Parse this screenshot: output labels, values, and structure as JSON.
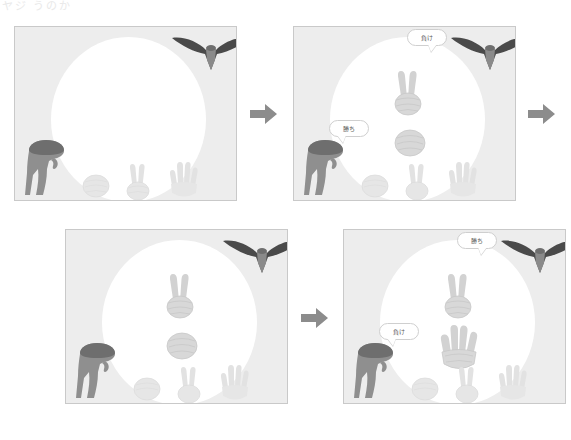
{
  "header": {
    "cropped_text": "ヤジ うのか"
  },
  "colors": {
    "panel_background": "#ededed",
    "panel_border": "#c9c9c9",
    "sun": "#ffffff",
    "dinosaur_body": "#8f8f8f",
    "dinosaur_head": "#6e6e6e",
    "pterodactyl_wing": "#4a4a4a",
    "pterodactyl_body": "#8a8a8a",
    "hand_bright": "#d8d8d8",
    "hand_faint": "#e6e6e6",
    "arrow": "#8c8c8c",
    "bubble_fill": "#ffffff",
    "bubble_border": "#cfcfcf",
    "bubble_text": "#5a5a5a"
  },
  "labels": {
    "win": "勝ち",
    "lose": "負け"
  },
  "icons": {
    "arrow": "arrow-right-icon",
    "rock": "hand-rock-icon",
    "scissors": "hand-scissors-icon",
    "paper": "hand-paper-icon",
    "dinosaur": "dinosaur-icon",
    "pterodactyl": "pterodactyl-icon",
    "sun": "sun-icon"
  },
  "panels": [
    {
      "id": "panel-1",
      "index": 1,
      "bottom_hands": [
        "rock",
        "scissors",
        "paper"
      ],
      "center_hands": [],
      "bubbles": []
    },
    {
      "id": "panel-2",
      "index": 2,
      "bottom_hands": [
        "rock",
        "scissors",
        "paper"
      ],
      "center_hands": [
        "scissors",
        "rock"
      ],
      "bubbles": [
        {
          "speaker": "pterodactyl",
          "text": "負け",
          "position": "top"
        },
        {
          "speaker": "dinosaur",
          "text": "勝ち",
          "position": "left"
        }
      ]
    },
    {
      "id": "panel-3",
      "index": 3,
      "bottom_hands": [
        "rock",
        "scissors",
        "paper"
      ],
      "center_hands": [
        "scissors",
        "rock"
      ],
      "bubbles": []
    },
    {
      "id": "panel-4",
      "index": 4,
      "bottom_hands": [
        "rock",
        "scissors",
        "paper"
      ],
      "center_hands": [
        "scissors",
        "paper"
      ],
      "bubbles": [
        {
          "speaker": "pterodactyl",
          "text": "勝ち",
          "position": "top"
        },
        {
          "speaker": "dinosaur",
          "text": "負け",
          "position": "left"
        }
      ]
    }
  ],
  "arrows": [
    {
      "id": "arrow-1",
      "from": "panel-1",
      "to": "panel-2"
    },
    {
      "id": "arrow-2",
      "from": "panel-2",
      "to": "panel-3"
    },
    {
      "id": "arrow-3",
      "from": "panel-3",
      "to": "panel-4"
    }
  ]
}
